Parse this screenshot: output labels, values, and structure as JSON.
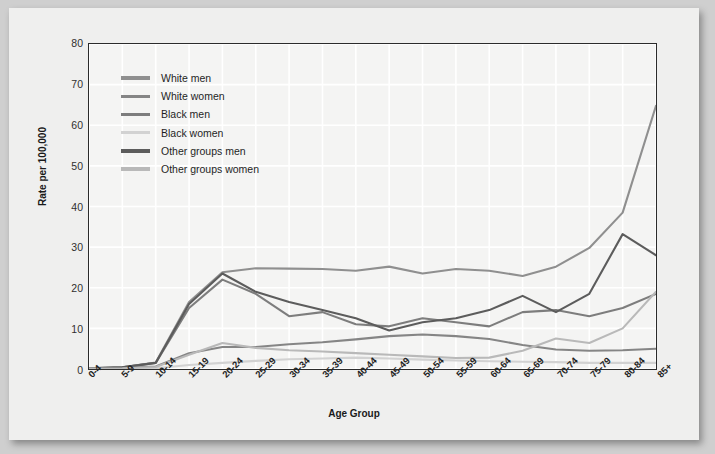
{
  "chart_data": {
    "type": "line",
    "title": "",
    "xlabel": "Age Group",
    "ylabel": "Rate per 100,000",
    "ylim": [
      0,
      80
    ],
    "yticks": [
      0,
      10,
      20,
      30,
      40,
      50,
      60,
      70,
      80
    ],
    "grid": true,
    "legend_position": "upper-left",
    "categories": [
      "0-4",
      "5-9",
      "10-14",
      "15-19",
      "20-24",
      "25-29",
      "30-34",
      "35-39",
      "40-44",
      "45-49",
      "50-54",
      "55-59",
      "60-64",
      "65-69",
      "70-74",
      "75-79",
      "80-84",
      "85+"
    ],
    "series": [
      {
        "name": "White men",
        "color": "#8f8f8f",
        "values": [
          0.2,
          0.4,
          1.6,
          16.5,
          23.8,
          24.8,
          24.7,
          24.6,
          24.2,
          25.2,
          23.5,
          24.6,
          24.2,
          22.9,
          25.2,
          29.8,
          38.5,
          64.8
        ]
      },
      {
        "name": "White women",
        "color": "#858585",
        "values": [
          0.1,
          0.3,
          0.6,
          3.9,
          5.4,
          5.4,
          6.1,
          6.6,
          7.3,
          8.1,
          8.5,
          8.1,
          7.4,
          5.9,
          4.8,
          4.5,
          4.6,
          5.0
        ]
      },
      {
        "name": "Black men",
        "color": "#7d7d7d",
        "values": [
          0.2,
          0.4,
          1.5,
          15.0,
          22.0,
          18.5,
          13.0,
          14.0,
          11.0,
          10.5,
          12.5,
          11.5,
          10.5,
          14.0,
          14.5,
          13.0,
          15.0,
          18.5
        ]
      },
      {
        "name": "Black women",
        "color": "#d2d2d2",
        "values": [
          0.1,
          0.1,
          0.2,
          1.0,
          1.5,
          2.0,
          2.4,
          2.6,
          2.8,
          2.6,
          2.3,
          2.1,
          1.9,
          1.8,
          1.7,
          1.5,
          1.5,
          1.5
        ]
      },
      {
        "name": "Other groups men",
        "color": "#5c5c5c",
        "values": [
          0.2,
          0.4,
          1.5,
          16.0,
          23.5,
          19.0,
          16.5,
          14.5,
          12.5,
          9.5,
          11.5,
          12.5,
          14.5,
          18.0,
          14.0,
          18.5,
          33.2,
          28.0
        ]
      },
      {
        "name": "Other groups women",
        "color": "#b9b9b9",
        "values": [
          0.1,
          0.2,
          0.5,
          3.5,
          6.4,
          5.2,
          4.6,
          4.3,
          3.9,
          3.5,
          3.1,
          2.7,
          2.8,
          4.5,
          7.5,
          6.4,
          10.0,
          19.0
        ]
      }
    ]
  }
}
